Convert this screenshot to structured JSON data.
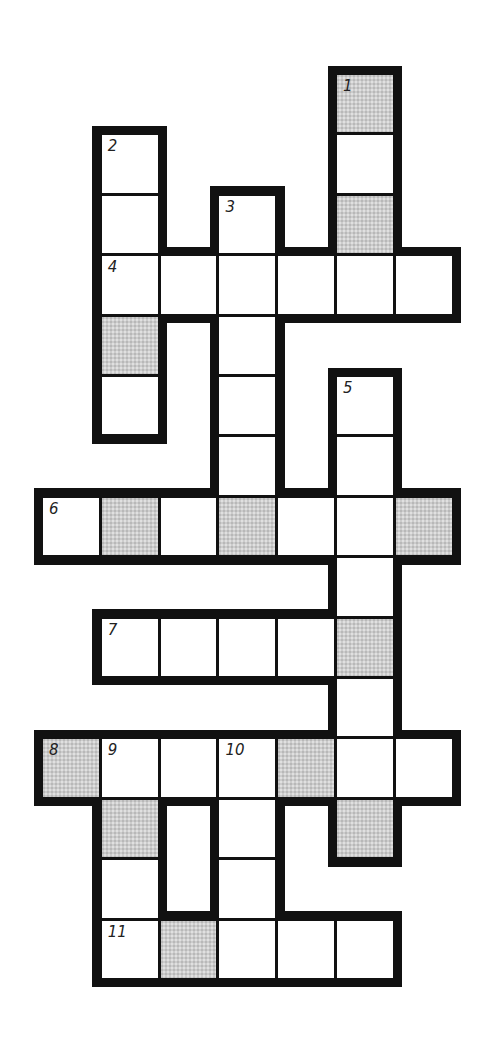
{
  "puzzle": {
    "type": "crossword",
    "columns": 7,
    "rows": 15,
    "colors": {
      "border": "#111111",
      "cell": "#ffffff",
      "shaded": "#cccccc",
      "number": "#222222"
    },
    "cells": [
      {
        "r": 0,
        "c": 5,
        "shaded": true,
        "num": "1"
      },
      {
        "r": 1,
        "c": 1,
        "shaded": false,
        "num": "2"
      },
      {
        "r": 1,
        "c": 5,
        "shaded": false,
        "num": ""
      },
      {
        "r": 2,
        "c": 1,
        "shaded": false,
        "num": ""
      },
      {
        "r": 2,
        "c": 3,
        "shaded": false,
        "num": "3"
      },
      {
        "r": 2,
        "c": 5,
        "shaded": true,
        "num": ""
      },
      {
        "r": 3,
        "c": 1,
        "shaded": false,
        "num": "4"
      },
      {
        "r": 3,
        "c": 2,
        "shaded": false,
        "num": ""
      },
      {
        "r": 3,
        "c": 3,
        "shaded": false,
        "num": ""
      },
      {
        "r": 3,
        "c": 4,
        "shaded": false,
        "num": ""
      },
      {
        "r": 3,
        "c": 5,
        "shaded": false,
        "num": ""
      },
      {
        "r": 3,
        "c": 6,
        "shaded": false,
        "num": ""
      },
      {
        "r": 4,
        "c": 1,
        "shaded": true,
        "num": ""
      },
      {
        "r": 4,
        "c": 3,
        "shaded": false,
        "num": ""
      },
      {
        "r": 5,
        "c": 1,
        "shaded": false,
        "num": ""
      },
      {
        "r": 5,
        "c": 3,
        "shaded": false,
        "num": ""
      },
      {
        "r": 5,
        "c": 5,
        "shaded": false,
        "num": "5"
      },
      {
        "r": 6,
        "c": 3,
        "shaded": false,
        "num": ""
      },
      {
        "r": 6,
        "c": 5,
        "shaded": false,
        "num": ""
      },
      {
        "r": 7,
        "c": 0,
        "shaded": false,
        "num": "6"
      },
      {
        "r": 7,
        "c": 1,
        "shaded": true,
        "num": ""
      },
      {
        "r": 7,
        "c": 2,
        "shaded": false,
        "num": ""
      },
      {
        "r": 7,
        "c": 3,
        "shaded": true,
        "num": ""
      },
      {
        "r": 7,
        "c": 4,
        "shaded": false,
        "num": ""
      },
      {
        "r": 7,
        "c": 5,
        "shaded": false,
        "num": ""
      },
      {
        "r": 7,
        "c": 6,
        "shaded": true,
        "num": ""
      },
      {
        "r": 8,
        "c": 5,
        "shaded": false,
        "num": ""
      },
      {
        "r": 9,
        "c": 1,
        "shaded": false,
        "num": "7"
      },
      {
        "r": 9,
        "c": 2,
        "shaded": false,
        "num": ""
      },
      {
        "r": 9,
        "c": 3,
        "shaded": false,
        "num": ""
      },
      {
        "r": 9,
        "c": 4,
        "shaded": false,
        "num": ""
      },
      {
        "r": 9,
        "c": 5,
        "shaded": true,
        "num": ""
      },
      {
        "r": 10,
        "c": 5,
        "shaded": false,
        "num": ""
      },
      {
        "r": 11,
        "c": 0,
        "shaded": true,
        "num": "8"
      },
      {
        "r": 11,
        "c": 1,
        "shaded": false,
        "num": "9"
      },
      {
        "r": 11,
        "c": 2,
        "shaded": false,
        "num": ""
      },
      {
        "r": 11,
        "c": 3,
        "shaded": false,
        "num": "10"
      },
      {
        "r": 11,
        "c": 4,
        "shaded": true,
        "num": ""
      },
      {
        "r": 11,
        "c": 5,
        "shaded": false,
        "num": ""
      },
      {
        "r": 11,
        "c": 6,
        "shaded": false,
        "num": ""
      },
      {
        "r": 12,
        "c": 1,
        "shaded": true,
        "num": ""
      },
      {
        "r": 12,
        "c": 3,
        "shaded": false,
        "num": ""
      },
      {
        "r": 12,
        "c": 5,
        "shaded": true,
        "num": ""
      },
      {
        "r": 13,
        "c": 1,
        "shaded": false,
        "num": ""
      },
      {
        "r": 13,
        "c": 3,
        "shaded": false,
        "num": ""
      },
      {
        "r": 14,
        "c": 1,
        "shaded": false,
        "num": "11"
      },
      {
        "r": 14,
        "c": 2,
        "shaded": true,
        "num": ""
      },
      {
        "r": 14,
        "c": 3,
        "shaded": false,
        "num": ""
      },
      {
        "r": 14,
        "c": 4,
        "shaded": false,
        "num": ""
      },
      {
        "r": 14,
        "c": 5,
        "shaded": false,
        "num": ""
      }
    ],
    "clue_numbers": [
      "1",
      "2",
      "3",
      "4",
      "5",
      "6",
      "7",
      "8",
      "9",
      "10",
      "11"
    ]
  }
}
